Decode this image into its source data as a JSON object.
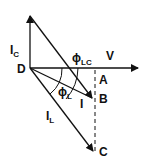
{
  "diagram": {
    "labels": {
      "ic": {
        "main": "I",
        "sub": "C"
      },
      "phi_lc": {
        "main": "ϕ",
        "sub": "LC"
      },
      "v": "V",
      "d": "D",
      "a": "A",
      "b": "B",
      "c": "C",
      "phi_l": {
        "main": "ϕ",
        "sub": "L"
      },
      "i": "I",
      "il": {
        "main": "I",
        "sub": "L"
      }
    },
    "colors": {
      "stroke": "#111111",
      "background": "#ffffff"
    }
  }
}
